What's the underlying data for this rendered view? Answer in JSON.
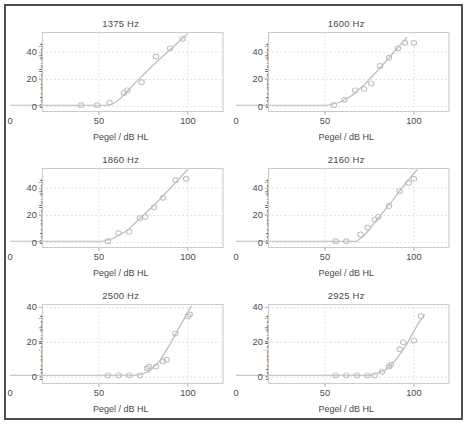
{
  "figure": {
    "name": "categorical-loudness-scaling-panels",
    "panel_count": 6,
    "layout": "3 rows x 2 columns"
  },
  "axes": {
    "xlabel": "Pegel / dB HL",
    "ylabel": "Kategoriallautheit",
    "xticks": [
      0,
      50,
      100
    ],
    "xticklabels": [
      "0",
      "50",
      "100"
    ],
    "yticks": [
      0,
      20,
      40
    ],
    "yticklabels": [
      "0",
      "20",
      "40"
    ],
    "xlim": [
      0,
      120
    ],
    "ylim": [
      -4,
      55
    ],
    "grid": true,
    "legend": "none"
  },
  "colors": {
    "frame": "#c8c8c8",
    "grid": "#dcdcdc",
    "marker": "#bdbdbd",
    "fit": "#b9b9b9",
    "text": "#4a4a4a",
    "outer_border": "#4d4d4d",
    "background": "#ffffff"
  },
  "chart_data": [
    {
      "type": "scatter",
      "title": "1375 Hz",
      "xlabel": "Pegel / dB HL",
      "ylabel": "Kategoriallautheit",
      "xlim": [
        0,
        120
      ],
      "ylim": [
        -4,
        55
      ],
      "xticks": [
        0,
        50,
        100
      ],
      "yticks": [
        0,
        20,
        40
      ],
      "grid": true,
      "x": [
        40,
        49,
        56,
        64,
        66,
        74,
        82,
        90,
        97
      ],
      "y": [
        1,
        1,
        3,
        10,
        12,
        18,
        37,
        43,
        50
      ],
      "fit_x": [
        0,
        20,
        40,
        55,
        58,
        62,
        70,
        80,
        90,
        100
      ],
      "fit_y": [
        1,
        1,
        1,
        1,
        2,
        6,
        17,
        30,
        42,
        54
      ]
    },
    {
      "type": "scatter",
      "title": "1600 Hz",
      "xlabel": "Pegel / dB HL",
      "ylabel": "Kategoriallautheit",
      "xlim": [
        0,
        120
      ],
      "ylim": [
        -4,
        55
      ],
      "xticks": [
        0,
        50,
        100
      ],
      "yticks": [
        0,
        20,
        40
      ],
      "grid": true,
      "x": [
        55,
        61,
        67,
        72,
        76,
        81,
        86,
        91,
        95,
        100
      ],
      "y": [
        1,
        5,
        12,
        13,
        17,
        30,
        36,
        43,
        47,
        47
      ],
      "fit_x": [
        0,
        20,
        40,
        52,
        58,
        65,
        72,
        80,
        88,
        96
      ],
      "fit_y": [
        1,
        1,
        1,
        1,
        3,
        8,
        16,
        27,
        39,
        51
      ]
    },
    {
      "type": "scatter",
      "title": "1860 Hz",
      "xlabel": "Pegel / dB HL",
      "ylabel": "Kategoriallautheit",
      "xlim": [
        0,
        120
      ],
      "ylim": [
        -4,
        55
      ],
      "xticks": [
        0,
        50,
        100
      ],
      "yticks": [
        0,
        20,
        40
      ],
      "grid": true,
      "x": [
        55,
        61,
        67,
        73,
        76,
        81,
        86,
        93,
        99
      ],
      "y": [
        1,
        7,
        8,
        18,
        19,
        26,
        33,
        46,
        47
      ],
      "fit_x": [
        0,
        20,
        40,
        52,
        58,
        66,
        74,
        82,
        90,
        100
      ],
      "fit_y": [
        1,
        1,
        1,
        1,
        3,
        9,
        19,
        29,
        40,
        54
      ]
    },
    {
      "type": "scatter",
      "title": "2160 Hz",
      "xlabel": "Pegel / dB HL",
      "ylabel": "Kategoriallautheit",
      "xlim": [
        0,
        120
      ],
      "ylim": [
        -4,
        55
      ],
      "xticks": [
        0,
        50,
        100
      ],
      "yticks": [
        0,
        20,
        40
      ],
      "grid": true,
      "x": [
        56,
        62,
        70,
        74,
        78,
        80,
        86,
        92,
        97,
        100
      ],
      "y": [
        1,
        1,
        6,
        11,
        17,
        19,
        27,
        38,
        44,
        47
      ],
      "fit_x": [
        0,
        20,
        40,
        60,
        68,
        72,
        80,
        88,
        96,
        102
      ],
      "fit_y": [
        1,
        1,
        1,
        1,
        1,
        5,
        18,
        31,
        45,
        54
      ]
    },
    {
      "type": "scatter",
      "title": "2500 Hz",
      "xlabel": "Pegel / dB HL",
      "ylabel": "Kategoriallautheit",
      "xlim": [
        0,
        120
      ],
      "ylim": [
        -4,
        42
      ],
      "xticks": [
        0,
        50,
        100
      ],
      "yticks": [
        0,
        20,
        40
      ],
      "grid": true,
      "x": [
        55,
        61,
        67,
        73,
        77,
        78,
        82,
        86,
        88,
        93,
        100,
        101
      ],
      "y": [
        1,
        1,
        1,
        1,
        5,
        6,
        6,
        9,
        10,
        25,
        35,
        36
      ],
      "fit_x": [
        0,
        20,
        40,
        60,
        72,
        78,
        84,
        90,
        96,
        102
      ],
      "fit_y": [
        1,
        1,
        1,
        1,
        1,
        3,
        9,
        19,
        30,
        41
      ]
    },
    {
      "type": "scatter",
      "title": "2925 Hz",
      "xlabel": "Pegel / dB HL",
      "ylabel": "Kategoriallautheit",
      "xlim": [
        0,
        120
      ],
      "ylim": [
        -4,
        42
      ],
      "xticks": [
        0,
        50,
        100
      ],
      "yticks": [
        0,
        20,
        40
      ],
      "grid": true,
      "x": [
        56,
        62,
        68,
        74,
        78,
        82,
        86,
        87,
        92,
        94,
        100,
        104
      ],
      "y": [
        1,
        1,
        1,
        1,
        1,
        3,
        6,
        7,
        16,
        20,
        21,
        35
      ],
      "fit_x": [
        0,
        20,
        40,
        60,
        76,
        84,
        90,
        96,
        102,
        106
      ],
      "fit_y": [
        1,
        1,
        1,
        1,
        1,
        4,
        10,
        19,
        30,
        36
      ]
    }
  ]
}
